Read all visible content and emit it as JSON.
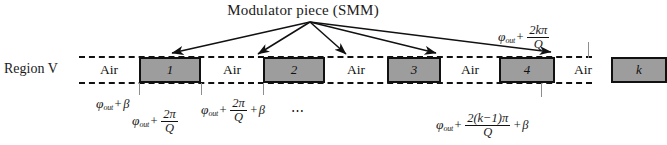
{
  "figure": {
    "title": "Modulator piece (SMM)",
    "region_label": "Region V",
    "ellipsis": "⋯",
    "colors": {
      "block_fill": "#9d9d9d",
      "outline": "#111111",
      "tick": "#8e8e8e",
      "background": "#ffffff"
    }
  },
  "channel": {
    "cells": [
      {
        "type": "air",
        "label": "Air"
      },
      {
        "type": "smm",
        "label": "1"
      },
      {
        "type": "air",
        "label": "Air"
      },
      {
        "type": "smm",
        "label": "2"
      },
      {
        "type": "air",
        "label": "Air"
      },
      {
        "type": "smm",
        "label": "3"
      },
      {
        "type": "air",
        "label": "Air"
      },
      {
        "type": "smm",
        "label": "4"
      },
      {
        "type": "air",
        "label": "Air"
      },
      {
        "type": "smm",
        "label": "k"
      }
    ]
  },
  "annotations": {
    "phi_symbol": "φ",
    "phi_subscript": "out",
    "plus": "+",
    "beta": "β",
    "pi": "π",
    "q": "Q",
    "top_right": {
      "numerator": "2kπ",
      "denominator": "Q",
      "text": "φout + 2kπ/Q"
    },
    "label_1": {
      "text": "φout + β"
    },
    "label_2": {
      "numerator": "2π",
      "denominator": "Q",
      "text": "φout + 2π/Q"
    },
    "label_3": {
      "numerator": "2π",
      "denominator": "Q",
      "text": "φout + 2π/Q + β"
    },
    "label_k": {
      "numerator": "2(k−1)π",
      "denominator": "Q",
      "text": "φout + 2(k−1)π/Q + β"
    }
  }
}
